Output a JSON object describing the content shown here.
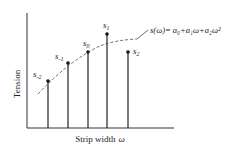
{
  "diagram": {
    "y_axis_label": "Tension",
    "x_axis_label_text": "Strip width",
    "x_axis_label_symbol": "ω",
    "formula": {
      "lhs": "s(ω)",
      "rhs": "= a₀+a₁ω+a₂ω²"
    },
    "samples": [
      {
        "label": "s",
        "sub": "-2",
        "x": 48,
        "top": 81
      },
      {
        "label": "s",
        "sub": "-1",
        "x": 68,
        "top": 63
      },
      {
        "label": "s",
        "sub": "0",
        "x": 88,
        "top": 52
      },
      {
        "label": "s",
        "sub": "1",
        "x": 107,
        "top": 34
      },
      {
        "label": "s",
        "sub": "2",
        "x": 128,
        "top": 52
      }
    ],
    "colors": {
      "line": "#222222",
      "background": "#ffffff"
    }
  }
}
